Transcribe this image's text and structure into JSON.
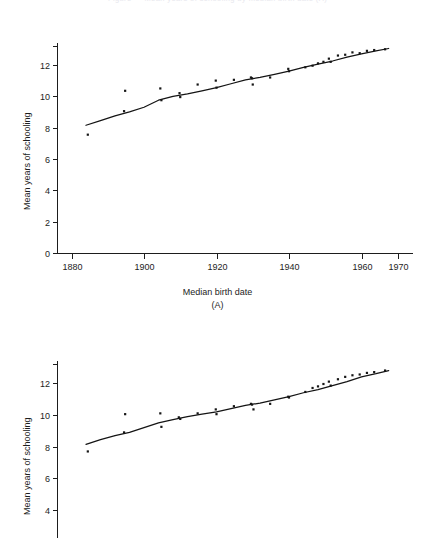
{
  "running_head": "Figure  —  Mean years of schooling by median birth date  (A)",
  "figures": [
    {
      "id": "A",
      "panel_label": "(A)",
      "ylabel": "Mean years of schooling",
      "xlabel": "Median birth date",
      "y_ticks": [
        "0",
        "2",
        "4",
        "6",
        "8",
        "10",
        "12"
      ],
      "x_ticks": [
        "1880",
        "1900",
        "1920",
        "1940",
        "1960",
        "1970"
      ]
    },
    {
      "id": "B",
      "panel_label": "",
      "ylabel": "Mean years of schooling",
      "xlabel": "",
      "y_ticks": [
        "2",
        "4",
        "6",
        "8",
        "10",
        "12"
      ],
      "x_ticks": []
    }
  ],
  "chart_data": [
    {
      "type": "scatter",
      "id": "A",
      "title": "",
      "panel_label": "(A)",
      "xlabel": "Median birth date",
      "ylabel": "Mean years of schooling",
      "xlim": [
        1876,
        1972
      ],
      "ylim": [
        0,
        13.4
      ],
      "xticks": [
        1880,
        1900,
        1920,
        1940,
        1960,
        1970
      ],
      "yticks": [
        0,
        2,
        4,
        6,
        8,
        10,
        12
      ],
      "grid": false,
      "legend": null,
      "series": [
        {
          "name": "Observed mean years of schooling",
          "marker": "square-dot",
          "x": [
            1884.5,
            1894.5,
            1894.8,
            1904.5,
            1904.8,
            1909.8,
            1910.0,
            1914.8,
            1919.8,
            1920.0,
            1924.8,
            1929.5,
            1929.8,
            1930.0,
            1934.8,
            1939.8,
            1940.0,
            1944.5,
            1946.5,
            1948.0,
            1949.5,
            1951.0,
            1951.5,
            1953.5,
            1955.5,
            1957.5,
            1959.5,
            1961.5,
            1963.5,
            1966.5
          ],
          "y": [
            7.55,
            9.05,
            10.35,
            10.5,
            9.75,
            10.2,
            9.95,
            10.75,
            11.0,
            10.55,
            11.05,
            11.2,
            11.15,
            10.75,
            11.2,
            11.75,
            11.6,
            11.85,
            11.95,
            12.1,
            12.2,
            12.4,
            12.2,
            12.6,
            12.65,
            12.8,
            12.75,
            12.9,
            12.95,
            13.0
          ]
        },
        {
          "name": "Fitted trend",
          "type": "line",
          "x": [
            1884.0,
            1888.0,
            1892.0,
            1896.0,
            1900.0,
            1904.0,
            1908.0,
            1912.0,
            1916.0,
            1920.0,
            1924.0,
            1928.0,
            1932.0,
            1936.0,
            1940.0,
            1944.0,
            1948.0,
            1952.0,
            1956.0,
            1960.0,
            1964.0,
            1967.5
          ],
          "y": [
            8.15,
            8.45,
            8.75,
            9.0,
            9.3,
            9.75,
            10.0,
            10.15,
            10.35,
            10.55,
            10.8,
            11.05,
            11.2,
            11.4,
            11.6,
            11.85,
            12.05,
            12.25,
            12.5,
            12.7,
            12.9,
            13.05
          ]
        }
      ]
    },
    {
      "type": "scatter",
      "id": "B",
      "title": "",
      "panel_label": "",
      "xlabel": "",
      "ylabel": "Mean years of schooling",
      "xlim": [
        1876,
        1972
      ],
      "ylim": [
        1.3,
        13.4
      ],
      "xticks": [],
      "yticks": [
        2,
        4,
        6,
        8,
        10,
        12
      ],
      "grid": false,
      "legend": null,
      "note": "Lower panel is cropped by the bottom edge of the page; x-axis not visible.",
      "series": [
        {
          "name": "Observed mean years of schooling",
          "marker": "square-dot",
          "x": [
            1884.5,
            1894.5,
            1894.8,
            1904.5,
            1904.8,
            1909.6,
            1910.0,
            1914.8,
            1919.8,
            1920.0,
            1924.8,
            1929.5,
            1929.8,
            1930.2,
            1934.8,
            1939.8,
            1940.0,
            1944.5,
            1946.5,
            1948.0,
            1949.5,
            1951.0,
            1951.5,
            1953.5,
            1955.5,
            1957.5,
            1959.5,
            1961.5,
            1963.5,
            1966.5
          ],
          "y": [
            7.7,
            8.9,
            10.05,
            10.1,
            9.25,
            9.85,
            9.75,
            10.1,
            10.35,
            10.05,
            10.55,
            10.7,
            10.65,
            10.35,
            10.7,
            11.15,
            11.1,
            11.45,
            11.7,
            11.8,
            11.95,
            12.1,
            11.85,
            12.25,
            12.4,
            12.5,
            12.55,
            12.65,
            12.7,
            12.8
          ]
        },
        {
          "name": "Fitted trend",
          "type": "line",
          "x": [
            1884.0,
            1888.0,
            1892.0,
            1896.0,
            1900.0,
            1904.0,
            1908.0,
            1912.0,
            1916.0,
            1920.0,
            1924.0,
            1928.0,
            1932.0,
            1936.0,
            1940.0,
            1944.0,
            1948.0,
            1952.0,
            1956.0,
            1960.0,
            1964.0,
            1967.5
          ],
          "y": [
            8.15,
            8.45,
            8.7,
            8.9,
            9.2,
            9.5,
            9.7,
            9.9,
            10.05,
            10.2,
            10.4,
            10.6,
            10.75,
            10.95,
            11.15,
            11.4,
            11.6,
            11.85,
            12.1,
            12.4,
            12.6,
            12.8
          ]
        }
      ]
    }
  ]
}
